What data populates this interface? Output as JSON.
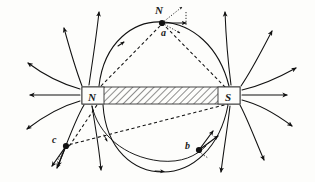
{
  "figure": {
    "background_color": "#fdfdfb",
    "ink_color": "#111111"
  },
  "magnet": {
    "north_label": "N",
    "south_label": "S",
    "fill_pattern": "diagonal-hatch",
    "x": 82,
    "y": 87,
    "width": 158,
    "height": 17
  },
  "points": [
    {
      "id": "a",
      "label": "a",
      "label_x": 163,
      "label_y": 34,
      "dot_x": 162,
      "dot_y": 23,
      "compass_label": "N",
      "compass_label_x": 155,
      "compass_label_y": 14
    },
    {
      "id": "b",
      "label": "b",
      "label_x": 188,
      "label_y": 148,
      "dot_x": 199,
      "dot_y": 150
    },
    {
      "id": "c",
      "label": "c",
      "label_x": 54,
      "label_y": 141,
      "dot_x": 66,
      "dot_y": 146
    }
  ],
  "field_lines": {
    "count": 18,
    "left_polarity": "outward",
    "right_polarity": "inward"
  }
}
